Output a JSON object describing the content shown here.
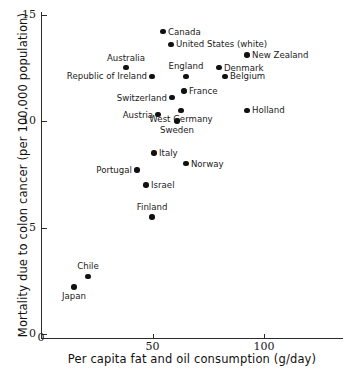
{
  "chart_data": {
    "type": "scatter",
    "title": "",
    "xlabel": "Per capita fat and oil consumption (g/day)",
    "ylabel": "Mortality due to colon cancer (per 100,000 population)",
    "xlim": [
      0,
      135
    ],
    "ylim": [
      0,
      15.6
    ],
    "xticks": [
      0,
      50,
      100
    ],
    "xtick_labels": [
      "0",
      "50",
      "100"
    ],
    "yticks": [
      0,
      5,
      10,
      15
    ],
    "ytick_labels": [
      "0",
      "5",
      "10",
      "15"
    ],
    "grid": false,
    "legend": null,
    "points": [
      {
        "label": "Canada",
        "x": 54.7,
        "y": 14.2,
        "label_pos": "right"
      },
      {
        "label": "United States (white)",
        "x": 58.3,
        "y": 13.6,
        "label_pos": "right"
      },
      {
        "label": "New Zealand",
        "x": 92.4,
        "y": 13.1,
        "label_pos": "right"
      },
      {
        "label": "Denmark",
        "x": 79.8,
        "y": 12.5,
        "label_pos": "right"
      },
      {
        "label": "Australia",
        "x": 38.1,
        "y": 12.5,
        "label_pos": "above"
      },
      {
        "label": "Belgium",
        "x": 82.5,
        "y": 12.1,
        "label_pos": "right"
      },
      {
        "label": "England",
        "x": 65.0,
        "y": 12.1,
        "label_pos": "above"
      },
      {
        "label": "Republic of Ireland",
        "x": 49.8,
        "y": 12.1,
        "label_pos": "left"
      },
      {
        "label": "France",
        "x": 64.1,
        "y": 11.4,
        "label_pos": "right"
      },
      {
        "label": "Switzerland",
        "x": 58.7,
        "y": 11.1,
        "label_pos": "left"
      },
      {
        "label": "Holland",
        "x": 92.4,
        "y": 10.5,
        "label_pos": "right"
      },
      {
        "label": "West Germany",
        "x": 62.8,
        "y": 10.5,
        "label_pos": "below"
      },
      {
        "label": "Austria",
        "x": 52.5,
        "y": 10.3,
        "label_pos": "left"
      },
      {
        "label": "Sweden",
        "x": 61.0,
        "y": 10.0,
        "label_pos": "below"
      },
      {
        "label": "Italy",
        "x": 50.7,
        "y": 8.5,
        "label_pos": "right"
      },
      {
        "label": "Norway",
        "x": 65.0,
        "y": 8.0,
        "label_pos": "right"
      },
      {
        "label": "Portugal",
        "x": 43.0,
        "y": 7.7,
        "label_pos": "left"
      },
      {
        "label": "Israel",
        "x": 47.1,
        "y": 7.0,
        "label_pos": "right"
      },
      {
        "label": "Finland",
        "x": 49.8,
        "y": 5.5,
        "label_pos": "above"
      },
      {
        "label": "Chile",
        "x": 21.1,
        "y": 2.7,
        "label_pos": "above"
      },
      {
        "label": "Japan",
        "x": 14.8,
        "y": 2.2,
        "label_pos": "below"
      }
    ]
  }
}
